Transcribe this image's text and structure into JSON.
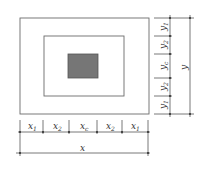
{
  "diagram": {
    "type": "nested-rectangles-dimension-drawing",
    "colors": {
      "line": "#6b6b6b",
      "core_fill": "#767676",
      "background": "#ffffff"
    },
    "rectangles": [
      {
        "name": "outer",
        "filled": false
      },
      {
        "name": "middle",
        "filled": false
      },
      {
        "name": "core",
        "filled": true
      }
    ],
    "horizontal_dimensions": {
      "segments": [
        {
          "label": "x",
          "sub": "1"
        },
        {
          "label": "x",
          "sub": "2"
        },
        {
          "label": "x",
          "sub": "c"
        },
        {
          "label": "x",
          "sub": "2"
        },
        {
          "label": "x",
          "sub": "1"
        }
      ],
      "total": {
        "label": "x"
      }
    },
    "vertical_dimensions": {
      "segments": [
        {
          "label": "y",
          "sub": "1"
        },
        {
          "label": "y",
          "sub": "2"
        },
        {
          "label": "y",
          "sub": "c"
        },
        {
          "label": "y",
          "sub": "2"
        },
        {
          "label": "y",
          "sub": "1"
        }
      ],
      "total": {
        "label": "y"
      }
    }
  }
}
